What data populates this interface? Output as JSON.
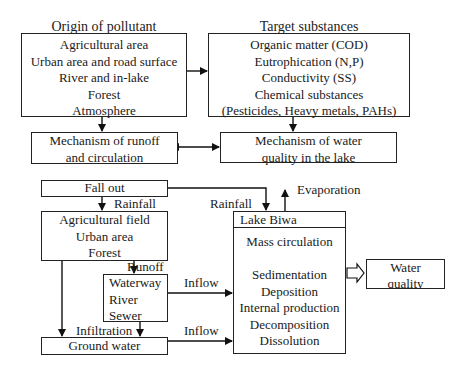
{
  "origin": {
    "title": "Origin of pollutant",
    "items": [
      "Agricultural area",
      "Urban area and road surface",
      "River and in-lake",
      "Forest",
      "Atmosphere"
    ]
  },
  "target": {
    "title": "Target substances",
    "items": [
      "Organic matter (COD)",
      "Eutrophication (N,P)",
      "Conductivity (SS)",
      "Chemical substances",
      "(Pesticides, Heavy metals, PAHs)"
    ]
  },
  "mechanism_runoff": {
    "lines": [
      "Mechanism of runoff",
      "and circulation"
    ]
  },
  "mechanism_lake": {
    "lines": [
      "Mechanism of water",
      "quality in the lake"
    ]
  },
  "fallout": {
    "label": "Fall out"
  },
  "labels": {
    "rainfall_left": "Rainfall",
    "rainfall_right": "Rainfall",
    "evaporation": "Evaporation",
    "runoff": "Runoff",
    "inflow_upper": "Inflow",
    "inflow_lower": "Inflow",
    "infiltration": "Infiltration"
  },
  "land": {
    "items": [
      "Agricultural field",
      "Urban area",
      "Forest"
    ]
  },
  "waterway": {
    "items": [
      "Waterway",
      "River",
      "Sewer"
    ]
  },
  "groundwater": {
    "label": "Ground water"
  },
  "lake": {
    "title": "Lake Biwa",
    "subtitle": "Mass circulation",
    "processes": [
      "Sedimentation",
      "Deposition",
      "Internal production",
      "Decomposition",
      "Dissolution"
    ]
  },
  "water_quality": {
    "lines": [
      "Water",
      "quality"
    ]
  }
}
